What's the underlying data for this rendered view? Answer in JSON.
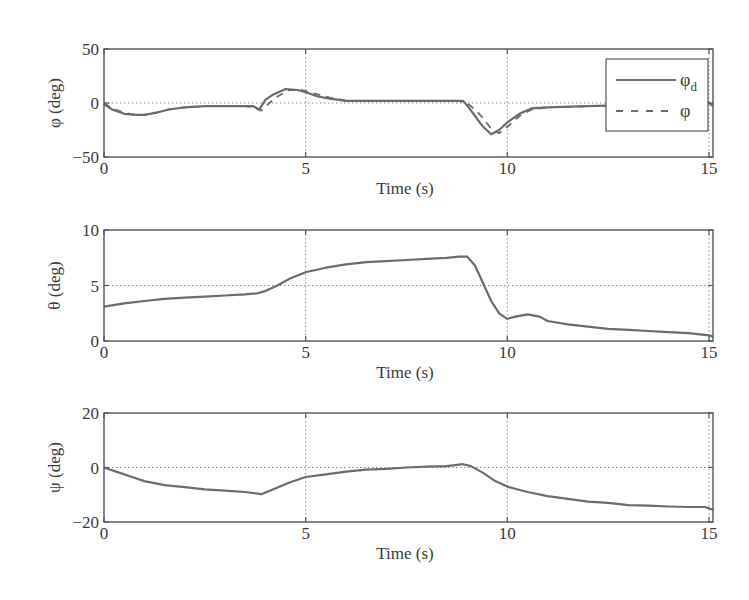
{
  "chart_data": [
    {
      "type": "line",
      "title": "",
      "xlabel": "Time (s)",
      "ylabel": "φ (deg)",
      "xlim": [
        0,
        15.1
      ],
      "ylim": [
        -50,
        50
      ],
      "xticks": [
        0,
        5,
        10,
        15
      ],
      "yticks": [
        -50,
        0,
        50
      ],
      "xtick_labels": [
        "0",
        "5",
        "10",
        "15"
      ],
      "ytick_labels": [
        "−50",
        "0",
        "50"
      ],
      "grid": true,
      "legend": {
        "position": "upper right",
        "entries": [
          {
            "label": "φ",
            "subscript": "d",
            "style": "solid"
          },
          {
            "label": "φ",
            "subscript": "",
            "style": "dashed"
          }
        ]
      },
      "series": [
        {
          "name": "φd",
          "style": "solid",
          "x": [
            0,
            0.2,
            0.5,
            0.8,
            1.0,
            1.3,
            1.6,
            2.0,
            2.5,
            3.0,
            3.5,
            3.7,
            3.85,
            4.0,
            4.2,
            4.5,
            4.8,
            5.0,
            5.3,
            5.6,
            6.0,
            7.0,
            8.0,
            8.7,
            8.9,
            9.0,
            9.2,
            9.4,
            9.6,
            9.8,
            10.0,
            10.3,
            10.6,
            11.0,
            12.0,
            13.0,
            14.0,
            15.0,
            15.1
          ],
          "values": [
            -1,
            -6,
            -10,
            -11,
            -11,
            -9,
            -6,
            -4,
            -3,
            -3,
            -3,
            -3,
            -6,
            3,
            8,
            13,
            12,
            10,
            6,
            4,
            2,
            2,
            2,
            2,
            2,
            -2,
            -12,
            -22,
            -29,
            -25,
            -18,
            -10,
            -5,
            -4,
            -3,
            -2,
            -1,
            0,
            -3
          ]
        },
        {
          "name": "φ",
          "style": "dashed",
          "x": [
            0,
            0.2,
            0.5,
            0.8,
            1.0,
            1.3,
            1.6,
            2.0,
            2.5,
            3.0,
            3.5,
            3.7,
            3.9,
            4.1,
            4.3,
            4.6,
            4.9,
            5.2,
            5.6,
            6.0,
            7.0,
            8.0,
            8.8,
            9.0,
            9.2,
            9.4,
            9.6,
            9.8,
            10.0,
            10.3,
            10.6,
            11.0,
            12.0,
            13.0,
            14.0,
            15.0
          ],
          "values": [
            0,
            -5,
            -9,
            -11,
            -11,
            -9,
            -6,
            -4,
            -3,
            -3,
            -3,
            -4,
            -7,
            0,
            6,
            12,
            12,
            9,
            5,
            2,
            2,
            2,
            2,
            0,
            -6,
            -14,
            -24,
            -28,
            -22,
            -12,
            -6,
            -4,
            -3,
            -2,
            -1,
            0
          ]
        }
      ]
    },
    {
      "type": "line",
      "title": "",
      "xlabel": "Time (s)",
      "ylabel": "θ (deg)",
      "xlim": [
        0,
        15.1
      ],
      "ylim": [
        0,
        10
      ],
      "xticks": [
        0,
        5,
        10,
        15
      ],
      "yticks": [
        0,
        5,
        10
      ],
      "xtick_labels": [
        "0",
        "5",
        "10",
        "15"
      ],
      "ytick_labels": [
        "0",
        "5",
        "10"
      ],
      "grid": true,
      "series": [
        {
          "name": "θ",
          "style": "solid",
          "x": [
            0,
            0.5,
            1.0,
            1.5,
            2.0,
            2.5,
            3.0,
            3.5,
            3.8,
            4.0,
            4.3,
            4.6,
            5.0,
            5.5,
            6.0,
            6.5,
            7.0,
            7.5,
            8.0,
            8.5,
            8.8,
            9.0,
            9.2,
            9.4,
            9.6,
            9.8,
            10.0,
            10.2,
            10.5,
            10.8,
            11.0,
            11.5,
            12.0,
            12.5,
            13.0,
            13.5,
            14.0,
            14.5,
            15.0,
            15.1
          ],
          "values": [
            3.1,
            3.4,
            3.6,
            3.8,
            3.9,
            4.0,
            4.1,
            4.2,
            4.3,
            4.5,
            5.0,
            5.6,
            6.2,
            6.6,
            6.9,
            7.1,
            7.2,
            7.3,
            7.4,
            7.5,
            7.6,
            7.6,
            6.8,
            5.2,
            3.6,
            2.5,
            2.0,
            2.2,
            2.4,
            2.2,
            1.8,
            1.5,
            1.3,
            1.1,
            1.0,
            0.9,
            0.8,
            0.7,
            0.5,
            0.4
          ]
        }
      ]
    },
    {
      "type": "line",
      "title": "",
      "xlabel": "Time (s)",
      "ylabel": "ψ (deg)",
      "xlim": [
        0,
        15.1
      ],
      "ylim": [
        -20,
        20
      ],
      "xticks": [
        0,
        5,
        10,
        15
      ],
      "yticks": [
        -20,
        0,
        20
      ],
      "xtick_labels": [
        "0",
        "5",
        "10",
        "15"
      ],
      "ytick_labels": [
        "−20",
        "0",
        "20"
      ],
      "grid": true,
      "series": [
        {
          "name": "ψ",
          "style": "solid",
          "x": [
            0,
            0.3,
            0.7,
            1.0,
            1.5,
            2.0,
            2.5,
            3.0,
            3.5,
            3.9,
            4.2,
            4.6,
            5.0,
            5.5,
            6.0,
            6.5,
            7.0,
            7.5,
            8.0,
            8.5,
            8.9,
            9.1,
            9.4,
            9.7,
            10.0,
            10.5,
            11.0,
            11.5,
            12.0,
            12.5,
            13.0,
            13.5,
            14.0,
            14.5,
            14.9,
            15.1
          ],
          "values": [
            0,
            -1.5,
            -3.5,
            -5,
            -6.5,
            -7.2,
            -8,
            -8.5,
            -9,
            -9.8,
            -8,
            -5.5,
            -3.5,
            -2.5,
            -1.5,
            -0.8,
            -0.5,
            0,
            0.3,
            0.5,
            1.2,
            0.5,
            -2,
            -5,
            -7,
            -9,
            -10.5,
            -11.5,
            -12.5,
            -13,
            -13.8,
            -14,
            -14.3,
            -14.5,
            -14.5,
            -15.5
          ]
        }
      ]
    }
  ],
  "panels": [
    {
      "ylabel": "φ (deg)",
      "xlabel": "Time (s)"
    },
    {
      "ylabel": "θ (deg)",
      "xlabel": "Time (s)"
    },
    {
      "ylabel": "ψ (deg)",
      "xlabel": "Time (s)"
    }
  ],
  "colors": {
    "line": "#6b6b6b",
    "axes": "#555555",
    "grid": "#8a8a8a",
    "text": "#3a3a3a",
    "background": "#ffffff"
  }
}
